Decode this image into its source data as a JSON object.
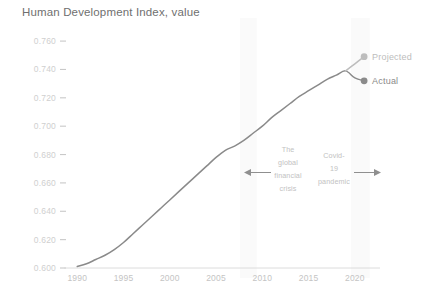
{
  "chart_data": {
    "type": "line",
    "title": "Human Development Index, value",
    "xlabel": "",
    "ylabel": "",
    "xlim": [
      1989,
      2022.5
    ],
    "ylim": [
      0.6,
      0.765
    ],
    "grid": false,
    "legend_position": "right-endpoint-labels",
    "y_ticks": [
      "0.760",
      "0.740",
      "0.720",
      "0.700",
      "0.680",
      "0.660",
      "0.640",
      "0.620",
      "0.600"
    ],
    "y_tick_values": [
      0.76,
      0.74,
      0.72,
      0.7,
      0.68,
      0.66,
      0.64,
      0.62,
      0.6
    ],
    "x_ticks": [
      "1990",
      "1995",
      "2000",
      "2005",
      "2010",
      "2015",
      "2020"
    ],
    "x_tick_values": [
      1990,
      1995,
      2000,
      2005,
      2010,
      2015,
      2020
    ],
    "x": [
      1990,
      1991,
      1992,
      1993,
      1994,
      1995,
      1996,
      1997,
      1998,
      1999,
      2000,
      2001,
      2002,
      2003,
      2004,
      2005,
      2006,
      2007,
      2008,
      2009,
      2010,
      2011,
      2012,
      2013,
      2014,
      2015,
      2016,
      2017,
      2018,
      2019,
      2020,
      2021
    ],
    "series": [
      {
        "name": "Actual",
        "color": "#8a8a8a",
        "values": [
          0.601,
          0.603,
          0.606,
          0.609,
          0.613,
          0.618,
          0.624,
          0.63,
          0.636,
          0.642,
          0.648,
          0.654,
          0.66,
          0.666,
          0.672,
          0.678,
          0.683,
          0.686,
          0.69,
          0.695,
          0.7,
          0.706,
          0.711,
          0.716,
          0.721,
          0.725,
          0.729,
          0.733,
          0.736,
          0.739,
          0.734,
          0.732
        ],
        "endpoint_label": "Actual",
        "endpoint_value": 0.732,
        "endpoint_year": 2021
      },
      {
        "name": "Projected",
        "color": "#bdbdbd",
        "values": [
          null,
          null,
          null,
          null,
          null,
          null,
          null,
          null,
          null,
          null,
          null,
          null,
          null,
          null,
          null,
          null,
          null,
          null,
          null,
          null,
          null,
          null,
          null,
          null,
          null,
          null,
          null,
          null,
          null,
          0.739,
          0.744,
          0.749
        ],
        "endpoint_label": "Projected",
        "endpoint_value": 0.749,
        "endpoint_year": 2021
      }
    ],
    "bands": [
      {
        "name": "global-financial-crisis-band",
        "x_start": 2007.6,
        "x_end": 2009.4,
        "color": "#fafafa"
      },
      {
        "name": "covid-pandemic-band",
        "x_start": 2019.6,
        "x_end": 2021.6,
        "color": "#fafafa"
      }
    ],
    "annotations": [
      {
        "name": "global-financial-crisis",
        "lines": [
          "The",
          "global",
          "financial",
          "crisis"
        ],
        "arrow": "left",
        "color": "#c2c2c2"
      },
      {
        "name": "covid-19-pandemic",
        "lines": [
          "Covid-",
          "19",
          "pandemic"
        ],
        "arrow": "right",
        "color": "#c2c2c2"
      }
    ]
  },
  "colors": {
    "actual": "#8a8a8a",
    "projected": "#bdbdbd",
    "title": "#6f6f6f",
    "tick": "#c4c4c4",
    "band": "#fafafa",
    "background": "#ffffff"
  },
  "legend": {
    "projected_label": "Projected",
    "actual_label": "Actual"
  }
}
